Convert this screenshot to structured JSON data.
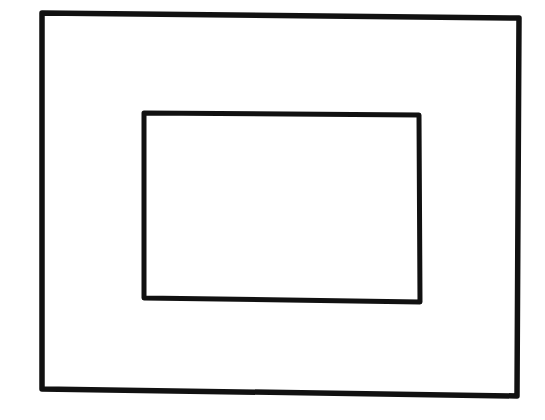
{
  "canvas": {
    "width": 545,
    "height": 420,
    "background": "#ffffff"
  },
  "diagram": {
    "shapes": [
      {
        "name": "outer-rectangle",
        "points": [
          [
            42,
            13
          ],
          [
            519,
            18
          ],
          [
            517,
            396
          ],
          [
            42,
            389
          ]
        ],
        "stroke": "#111111",
        "stroke_width": 5.5
      },
      {
        "name": "inner-rectangle",
        "points": [
          [
            144,
            113
          ],
          [
            419,
            115
          ],
          [
            420,
            302
          ],
          [
            144,
            298
          ]
        ],
        "stroke": "#111111",
        "stroke_width": 5
      }
    ]
  }
}
